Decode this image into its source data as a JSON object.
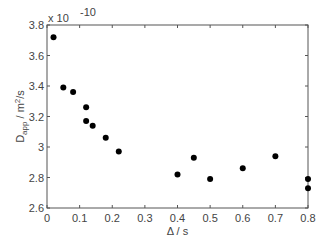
{
  "chart_data": {
    "type": "scatter",
    "title": "",
    "xlabel": "Δ / s",
    "ylabel": "D_app / m²/s",
    "ylabel_main": "D",
    "ylabel_sub": "app",
    "ylabel_unit": " / m",
    "ylabel_sup": "2",
    "ylabel_tail": "/s",
    "y_multiplier": "x 10",
    "y_multiplier_exp": "-10",
    "xlim": [
      0,
      0.8
    ],
    "ylim": [
      2.6,
      3.8
    ],
    "xticks": [
      "0",
      "0.1",
      "0.2",
      "0.3",
      "0.4",
      "0.5",
      "0.6",
      "0.7",
      "0.8"
    ],
    "yticks": [
      "2.6",
      "2.8",
      "3",
      "3.2",
      "3.4",
      "3.6",
      "3.8"
    ],
    "grid": false,
    "marker_color": "#000000",
    "points": [
      {
        "x": 0.02,
        "y": 3.72
      },
      {
        "x": 0.05,
        "y": 3.39
      },
      {
        "x": 0.08,
        "y": 3.36
      },
      {
        "x": 0.12,
        "y": 3.26
      },
      {
        "x": 0.12,
        "y": 3.17
      },
      {
        "x": 0.14,
        "y": 3.14
      },
      {
        "x": 0.18,
        "y": 3.06
      },
      {
        "x": 0.22,
        "y": 2.97
      },
      {
        "x": 0.4,
        "y": 2.82
      },
      {
        "x": 0.45,
        "y": 2.93
      },
      {
        "x": 0.5,
        "y": 2.79
      },
      {
        "x": 0.6,
        "y": 2.86
      },
      {
        "x": 0.7,
        "y": 2.94
      },
      {
        "x": 0.8,
        "y": 2.79
      },
      {
        "x": 0.8,
        "y": 2.73
      }
    ]
  }
}
